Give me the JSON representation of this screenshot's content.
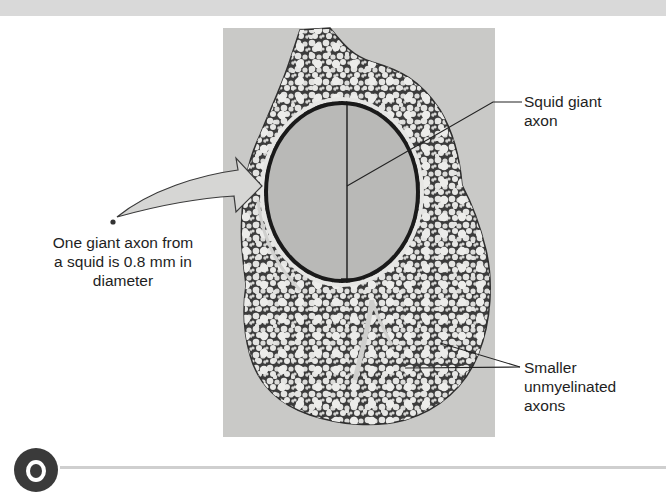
{
  "figure": {
    "type": "labeled micrograph",
    "labels": {
      "giant_axon": "Squid giant axon",
      "giant_axon_line1": "Squid giant",
      "giant_axon_line2": "axon",
      "smaller_axons_line1": "Smaller",
      "smaller_axons_line2": "unmyelinated",
      "smaller_axons_line3": "axons",
      "callout_line1": "One giant axon from",
      "callout_line2": "a squid is 0.8 mm in",
      "callout_line3": "diameter"
    },
    "measurement": {
      "axon_diameter": "0.8 mm"
    },
    "colors": {
      "photo_background": "#c9c9c7",
      "tissue_dark": "#3c3c3c",
      "axon_interior": "#b9b9b7",
      "small_axon_fill": "#e4e4e2",
      "arrow_fill": "#d6d6d4",
      "label_text": "#1e1e1e",
      "top_band": "#d9d9d9",
      "badge": "#3a3a3a"
    }
  }
}
